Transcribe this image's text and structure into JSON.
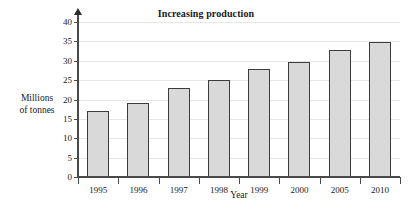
{
  "chart_data": {
    "type": "bar",
    "title": "Increasing production",
    "xlabel": "Year",
    "ylabel": "Millions of tonnes",
    "ylabel_lines": [
      "Millions",
      "of tonnes"
    ],
    "categories": [
      "1995",
      "1996",
      "1997",
      "1998",
      "1999",
      "2000",
      "2005",
      "2010"
    ],
    "values": [
      17,
      19,
      23,
      25,
      27.8,
      29.8,
      32.8,
      34.8
    ],
    "ylim": [
      0,
      40
    ],
    "yticks": [
      0,
      5,
      10,
      15,
      20,
      25,
      30,
      35,
      40
    ],
    "ytick_labels": [
      "0",
      "5",
      "10",
      "15",
      "20",
      "25",
      "30",
      "35",
      "40"
    ],
    "grid": true,
    "legend": "none",
    "bar_fill": "#d9d9d9",
    "bar_border": "#3c3c3c",
    "grid_color": "#e6e6e6",
    "axis_color": "#4a4a4a"
  }
}
